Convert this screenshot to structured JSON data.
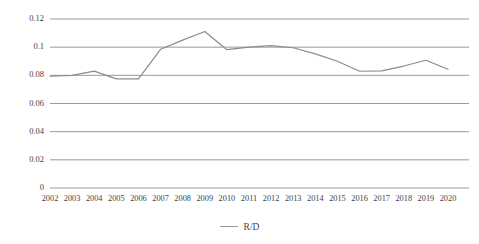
{
  "chart_data": {
    "type": "line",
    "title": "",
    "subtitle": "",
    "xlabel": "",
    "ylabel": "",
    "categories": [
      "2002",
      "2003",
      "2004",
      "2005",
      "2006",
      "2007",
      "2008",
      "2009",
      "2010",
      "2011",
      "2012",
      "2013",
      "2014",
      "2015",
      "2016",
      "2017",
      "2018",
      "2019",
      "2020"
    ],
    "series": [
      {
        "name": "R/D",
        "color": "#8c8c8c",
        "values": [
          0.0795,
          0.08,
          0.083,
          0.0775,
          0.0775,
          0.0985,
          0.105,
          0.1111,
          0.0982,
          0.1,
          0.1011,
          0.0996,
          0.0952,
          0.09,
          0.0829,
          0.0832,
          0.0866,
          0.0907,
          0.0843
        ]
      }
    ],
    "ylim": [
      0,
      0.12
    ],
    "yticks": [
      0,
      0.02,
      0.04,
      0.06,
      0.08,
      0.1,
      0.12
    ],
    "ytick_labels": [
      "0",
      "0.02",
      "0.04",
      "0.06",
      "0.08",
      "0.1",
      "0.12"
    ],
    "grid": true,
    "grid_color": "#9a9a9a",
    "legend_position": "bottom",
    "legend_entries": [
      "R/D"
    ]
  },
  "legend": {
    "entry_label": "R/D"
  }
}
